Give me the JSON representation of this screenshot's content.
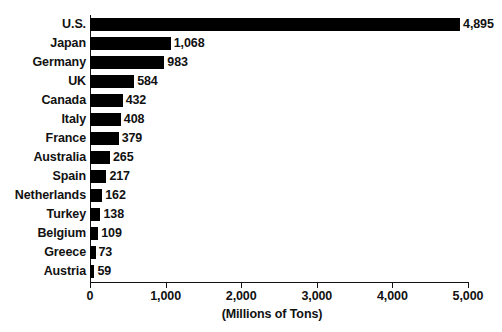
{
  "chart_data": {
    "type": "bar",
    "orientation": "horizontal",
    "title": "",
    "xlabel": "(Millions of Tons)",
    "ylabel": "",
    "xlim": [
      0,
      5000
    ],
    "xticks": [
      "0",
      "1,000",
      "2,000",
      "3,000",
      "4,000",
      "5,000"
    ],
    "xtick_values": [
      0,
      1000,
      2000,
      3000,
      4000,
      5000
    ],
    "grid": false,
    "legend": null,
    "bar_color": "#000000",
    "categories": [
      "U.S.",
      "Japan",
      "Germany",
      "UK",
      "Canada",
      "Italy",
      "France",
      "Australia",
      "Spain",
      "Netherlands",
      "Turkey",
      "Belgium",
      "Greece",
      "Austria"
    ],
    "values": [
      4895,
      1068,
      983,
      584,
      432,
      408,
      379,
      265,
      217,
      162,
      138,
      109,
      73,
      59
    ],
    "value_labels": [
      "4,895",
      "1,068",
      "983",
      "584",
      "432",
      "408",
      "379",
      "265",
      "217",
      "162",
      "138",
      "109",
      "73",
      "59"
    ],
    "bars": [
      {
        "category": "U.S.",
        "value": 4895,
        "label": "4,895"
      },
      {
        "category": "Japan",
        "value": 1068,
        "label": "1,068"
      },
      {
        "category": "Germany",
        "value": 983,
        "label": "983"
      },
      {
        "category": "UK",
        "value": 584,
        "label": "584"
      },
      {
        "category": "Canada",
        "value": 432,
        "label": "432"
      },
      {
        "category": "Italy",
        "value": 408,
        "label": "408"
      },
      {
        "category": "France",
        "value": 379,
        "label": "379"
      },
      {
        "category": "Australia",
        "value": 265,
        "label": "265"
      },
      {
        "category": "Spain",
        "value": 217,
        "label": "217"
      },
      {
        "category": "Netherlands",
        "value": 162,
        "label": "162"
      },
      {
        "category": "Turkey",
        "value": 138,
        "label": "138"
      },
      {
        "category": "Belgium",
        "value": 109,
        "label": "109"
      },
      {
        "category": "Greece",
        "value": 73,
        "label": "73"
      },
      {
        "category": "Austria",
        "value": 59,
        "label": "59"
      }
    ]
  }
}
